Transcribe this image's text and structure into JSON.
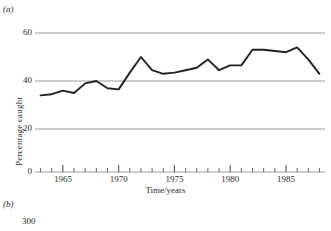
{
  "figure": {
    "panel_a_letter": "(a)",
    "panel_b_letter": "(b)"
  },
  "chart_data": {
    "type": "line",
    "title": "",
    "xlabel": "Time/years",
    "ylabel": "Percentage caught",
    "xlim": [
      1962.5,
      1988.5
    ],
    "ylim": [
      0,
      60
    ],
    "yticks": [
      0,
      20,
      40,
      60
    ],
    "ytick_labels": [
      "0",
      "20",
      "40",
      "60"
    ],
    "xticks": [
      1965,
      1970,
      1975,
      1980,
      1985
    ],
    "xtick_labels": [
      "1965",
      "1970",
      "1975",
      "1980",
      "1985"
    ],
    "minor_xticks_every": 1,
    "grid": "horizontal-only",
    "legend": "none",
    "line_color": "#222222",
    "grid_color": "#9a9a9a",
    "x": [
      1963,
      1964,
      1965,
      1966,
      1967,
      1968,
      1969,
      1970,
      1971,
      1972,
      1973,
      1974,
      1975,
      1976,
      1977,
      1978,
      1979,
      1980,
      1981,
      1982,
      1983,
      1984,
      1985,
      1986,
      1987,
      1988
    ],
    "values": [
      34,
      34.5,
      36,
      35,
      39,
      40,
      37,
      36.5,
      43.5,
      50,
      44.5,
      43,
      43.5,
      44.5,
      45.5,
      49,
      44.5,
      46.5,
      46.5,
      53,
      53,
      52.5,
      52,
      54,
      49,
      43
    ],
    "series": [
      {
        "name": "Percentage caught",
        "values": [
          34,
          34.5,
          36,
          35,
          39,
          40,
          37,
          36.5,
          43.5,
          50,
          44.5,
          43,
          43.5,
          44.5,
          45.5,
          49,
          44.5,
          46.5,
          46.5,
          53,
          53,
          52.5,
          52,
          54,
          49,
          43
        ]
      }
    ]
  },
  "panel_b": {
    "ytick_label": "300"
  }
}
